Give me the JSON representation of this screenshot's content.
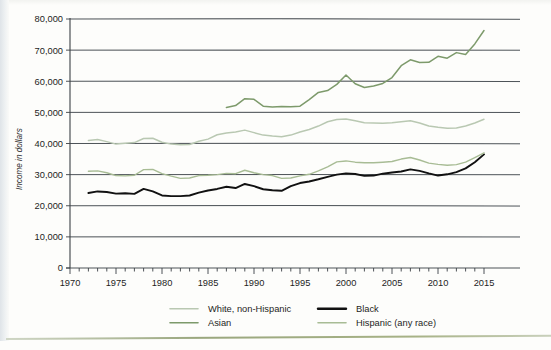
{
  "chart_data": {
    "type": "line",
    "title": "",
    "xlabel": "",
    "ylabel": "Income in dollars",
    "xlim": [
      1970,
      2015
    ],
    "ylim": [
      0,
      80000
    ],
    "ytick_labels": [
      "80,000",
      "70,000",
      "60,000",
      "50,000",
      "40,000",
      "30,000",
      "20,000",
      "10,000",
      "0"
    ],
    "ytick_values": [
      80000,
      70000,
      60000,
      50000,
      40000,
      30000,
      20000,
      10000,
      0
    ],
    "xtick_labels": [
      "1970",
      "1975",
      "1980",
      "1985",
      "1990",
      "1995",
      "2000",
      "2005",
      "2010",
      "2015"
    ],
    "xtick_values": [
      1970,
      1975,
      1980,
      1985,
      1990,
      1995,
      2000,
      2005,
      2010,
      2015
    ],
    "grid": true,
    "minor_xticks": "every year",
    "legend_position": "bottom",
    "series": [
      {
        "name": "White, non-Hispanic",
        "color": "#b9c8b2",
        "x": [
          1972,
          1973,
          1974,
          1975,
          1976,
          1977,
          1978,
          1979,
          1980,
          1981,
          1982,
          1983,
          1984,
          1985,
          1986,
          1987,
          1988,
          1989,
          1990,
          1991,
          1992,
          1993,
          1994,
          1995,
          1996,
          1997,
          1998,
          1999,
          2000,
          2001,
          2002,
          2003,
          2004,
          2005,
          2006,
          2007,
          2008,
          2009,
          2010,
          2011,
          2012,
          2013,
          2014,
          2015
        ],
        "values": [
          41000,
          41300,
          40600,
          39800,
          40100,
          40300,
          41600,
          41700,
          40400,
          39800,
          39600,
          39700,
          40700,
          41400,
          42800,
          43400,
          43700,
          44300,
          43500,
          42700,
          42400,
          42200,
          42700,
          43700,
          44500,
          45600,
          47000,
          47700,
          47900,
          47300,
          46700,
          46600,
          46500,
          46700,
          47000,
          47300,
          46600,
          45600,
          45200,
          44900,
          45000,
          45600,
          46600,
          47800
        ],
        "note": "Light sage green line; highest of the three non-Asian groups for most of the period."
      },
      {
        "name": "Asian",
        "color": "#7d9a6b",
        "x": [
          1987,
          1988,
          1989,
          1990,
          1991,
          1992,
          1993,
          1994,
          1995,
          1996,
          1997,
          1998,
          1999,
          2000,
          2001,
          2002,
          2003,
          2004,
          2005,
          2006,
          2007,
          2008,
          2009,
          2010,
          2011,
          2012,
          2013,
          2014,
          2015
        ],
        "values": [
          51600,
          52200,
          54400,
          54200,
          52000,
          51700,
          51900,
          51800,
          52000,
          54100,
          56400,
          57000,
          59000,
          62000,
          59200,
          58000,
          58500,
          59300,
          61200,
          65000,
          66900,
          66000,
          66100,
          68000,
          67400,
          69200,
          68600,
          72000,
          76300
        ],
        "note": "Darker green line, begins 1987, rises steeply after 2005 to the highest value on the chart."
      },
      {
        "name": "Black",
        "color": "#111111",
        "x": [
          1972,
          1973,
          1974,
          1975,
          1976,
          1977,
          1978,
          1979,
          1980,
          1981,
          1982,
          1983,
          1984,
          1985,
          1986,
          1987,
          1988,
          1989,
          1990,
          1991,
          1992,
          1993,
          1994,
          1995,
          1996,
          1997,
          1998,
          1999,
          2000,
          2001,
          2002,
          2003,
          2004,
          2005,
          2006,
          2007,
          2008,
          2009,
          2010,
          2011,
          2012,
          2013,
          2014,
          2015
        ],
        "values": [
          24100,
          24600,
          24400,
          23900,
          24000,
          23800,
          25400,
          24600,
          23300,
          23100,
          23100,
          23300,
          24200,
          24900,
          25400,
          26100,
          25700,
          27000,
          26300,
          25300,
          25000,
          24800,
          26300,
          27300,
          27800,
          28500,
          29300,
          30000,
          30400,
          30200,
          29600,
          29700,
          30300,
          30700,
          31000,
          31700,
          31200,
          30400,
          29700,
          30100,
          30800,
          32000,
          34000,
          36500
        ],
        "note": "Solid black line, lowest series throughout."
      },
      {
        "name": "Hispanic (any race)",
        "color": "#a8bc95",
        "x": [
          1972,
          1973,
          1974,
          1975,
          1976,
          1977,
          1978,
          1979,
          1980,
          1981,
          1982,
          1983,
          1984,
          1985,
          1986,
          1987,
          1988,
          1989,
          1990,
          1991,
          1992,
          1993,
          1994,
          1995,
          1996,
          1997,
          1998,
          1999,
          2000,
          2001,
          2002,
          2003,
          2004,
          2005,
          2006,
          2007,
          2008,
          2009,
          2010,
          2011,
          2012,
          2013,
          2014,
          2015
        ],
        "values": [
          31100,
          31200,
          30600,
          29700,
          29600,
          29800,
          31600,
          31700,
          30300,
          29500,
          28800,
          28900,
          29700,
          29800,
          30000,
          30400,
          30300,
          31400,
          30600,
          30000,
          29700,
          28800,
          28900,
          29600,
          30100,
          31200,
          32500,
          34100,
          34400,
          34000,
          33800,
          33800,
          34000,
          34200,
          35000,
          35500,
          34700,
          33700,
          33300,
          33000,
          33200,
          34000,
          35500,
          37000
        ],
        "note": "Medium sage green line, tracks just above the Black series and just below White, non-Hispanic."
      }
    ]
  },
  "legend": {
    "entries": [
      {
        "label": "White, non-Hispanic",
        "color": "#b9c8b2"
      },
      {
        "label": "Black",
        "color": "#111111"
      },
      {
        "label": "Asian",
        "color": "#7d9a6b"
      },
      {
        "label": "Hispanic (any race)",
        "color": "#a8bc95"
      }
    ]
  }
}
